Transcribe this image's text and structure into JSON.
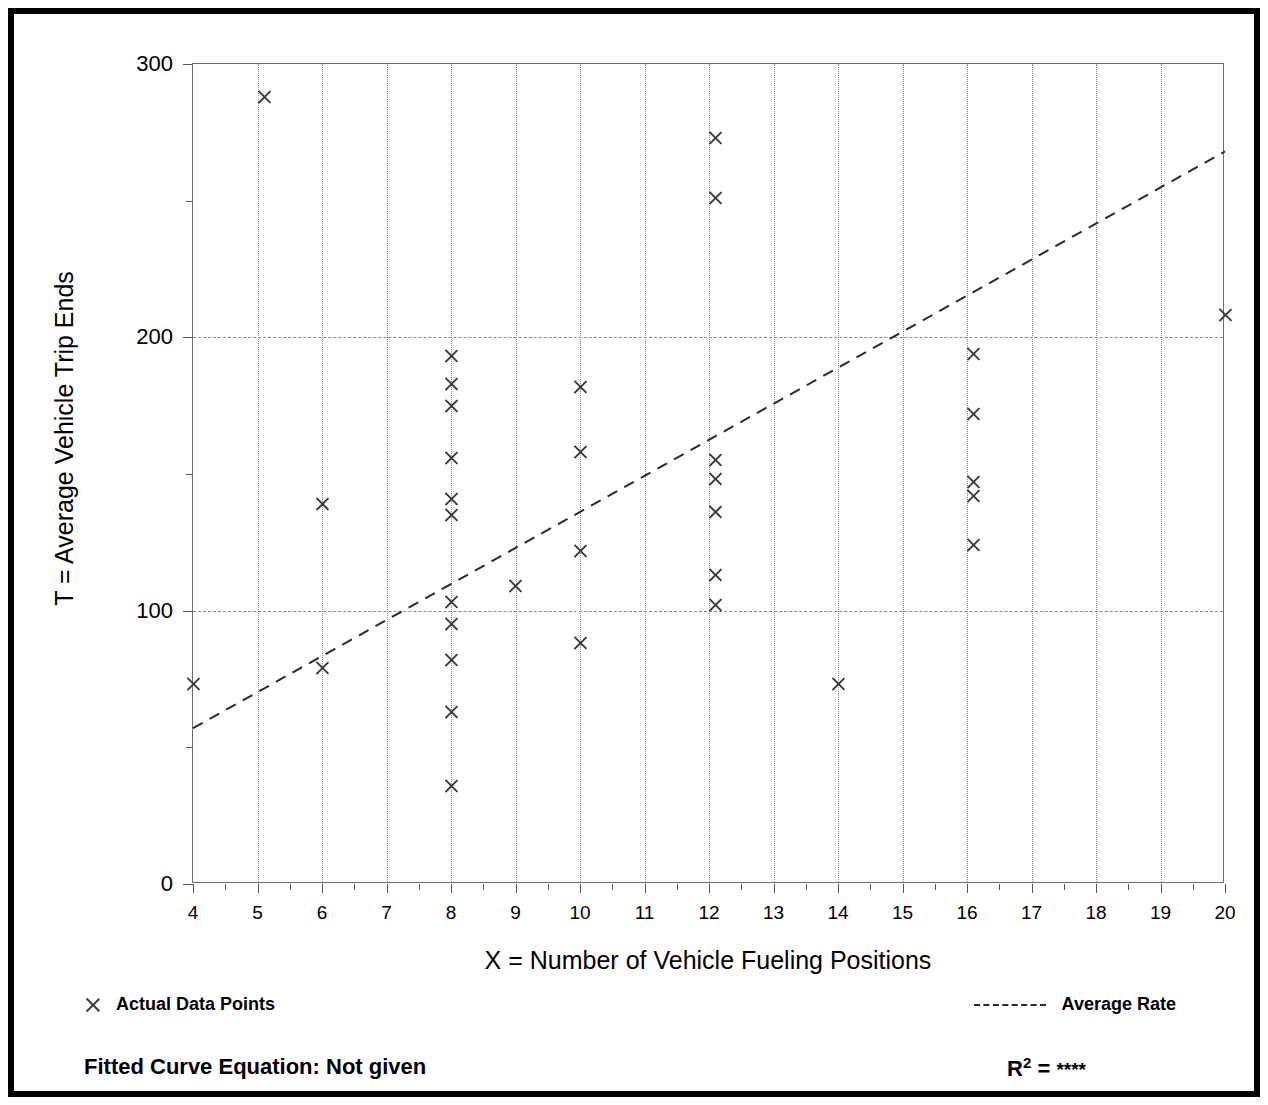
{
  "chart_data": {
    "type": "scatter",
    "title": "",
    "xlabel": "X = Number of Vehicle Fueling Positions",
    "ylabel": "T = Average Vehicle Trip Ends",
    "xlim": [
      4,
      20
    ],
    "ylim": [
      0,
      300
    ],
    "xticks": [
      4,
      5,
      6,
      7,
      8,
      9,
      10,
      11,
      12,
      13,
      14,
      15,
      16,
      17,
      18,
      19,
      20
    ],
    "yticks": [
      0,
      100,
      200,
      300
    ],
    "yticks_minor": [
      50,
      150,
      250
    ],
    "grid": "vertical dotted at every x integer; horizontal dashed at 100 and 200",
    "legend_position": "below-plot",
    "series": [
      {
        "name": "Actual Data Points",
        "marker": "x",
        "points": [
          {
            "x": 4,
            "y": 73
          },
          {
            "x": 5.1,
            "y": 288
          },
          {
            "x": 6,
            "y": 139
          },
          {
            "x": 6,
            "y": 79
          },
          {
            "x": 8,
            "y": 193
          },
          {
            "x": 8,
            "y": 183
          },
          {
            "x": 8,
            "y": 175
          },
          {
            "x": 8,
            "y": 156
          },
          {
            "x": 8,
            "y": 141
          },
          {
            "x": 8,
            "y": 135
          },
          {
            "x": 8,
            "y": 103
          },
          {
            "x": 8,
            "y": 95
          },
          {
            "x": 8,
            "y": 82
          },
          {
            "x": 8,
            "y": 63
          },
          {
            "x": 8,
            "y": 36
          },
          {
            "x": 9,
            "y": 109
          },
          {
            "x": 10,
            "y": 182
          },
          {
            "x": 10,
            "y": 158
          },
          {
            "x": 10,
            "y": 122
          },
          {
            "x": 10,
            "y": 88
          },
          {
            "x": 12.1,
            "y": 273
          },
          {
            "x": 12.1,
            "y": 251
          },
          {
            "x": 12.1,
            "y": 155
          },
          {
            "x": 12.1,
            "y": 148
          },
          {
            "x": 12.1,
            "y": 136
          },
          {
            "x": 12.1,
            "y": 113
          },
          {
            "x": 12.1,
            "y": 102
          },
          {
            "x": 14,
            "y": 73
          },
          {
            "x": 16.1,
            "y": 194
          },
          {
            "x": 16.1,
            "y": 172
          },
          {
            "x": 16.1,
            "y": 147
          },
          {
            "x": 16.1,
            "y": 142
          },
          {
            "x": 16.1,
            "y": 124
          },
          {
            "x": 20,
            "y": 208
          }
        ]
      },
      {
        "name": "Average Rate",
        "type": "line",
        "style": "dashed",
        "endpoints": [
          {
            "x": 4,
            "y": 57
          },
          {
            "x": 20,
            "y": 268
          }
        ]
      }
    ]
  },
  "legend": {
    "data_points_label": "Actual Data Points",
    "average_rate_label": "Average Rate",
    "marker_icon": "x-marker-icon",
    "line_icon": "dashed-line-icon"
  },
  "footer": {
    "fitted_equation": "Fitted Curve Equation:  Not given",
    "r_label": "R",
    "r_exponent": "2",
    "r_equals": " = ",
    "r_value": "****"
  },
  "axis": {
    "x_title": "X = Number of Vehicle Fueling Positions",
    "y_title": "T = Average Vehicle Trip Ends",
    "x_tick_labels": [
      "4",
      "5",
      "6",
      "7",
      "8",
      "9",
      "10",
      "11",
      "12",
      "13",
      "14",
      "15",
      "16",
      "17",
      "18",
      "19",
      "20"
    ],
    "y_tick_labels": [
      "0",
      "100",
      "200",
      "300"
    ]
  },
  "colors": {
    "frame": "#000000",
    "plot_border": "#6e6e6e",
    "grid": "#8a8a8a",
    "marker": "#3a3a3a",
    "trend": "#2a2a2a",
    "background": "#ffffff"
  }
}
